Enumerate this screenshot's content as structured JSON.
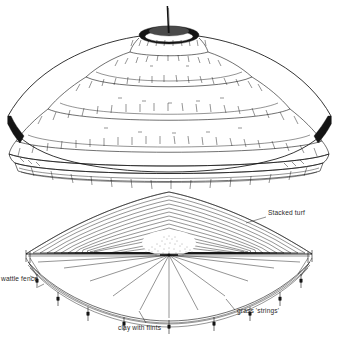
{
  "figure": {
    "background_color": "#ffffff",
    "ink_color": "#111111",
    "views": [
      {
        "id": "upper",
        "name": "perspective-reconstruction",
        "description": "Quarter-cut perspective view of the completed conical stacked-turf mound with central post at the apex",
        "features": [
          "central post",
          "apex opening",
          "concentric stepped turf courses",
          "cut section face",
          "basal wattle fence ring"
        ],
        "ring_count": 6,
        "labels": []
      },
      {
        "id": "lower",
        "name": "cutaway-construction-diagram",
        "description": "Quarter cutaway plan-perspective showing internal construction layers of the mound",
        "features": [
          "stacked turf contour courses",
          "stippled central core",
          "radial grass strings",
          "perimeter wattle fence",
          "clay with flints base"
        ],
        "turf_course_count": 14,
        "labels": [
          {
            "id": "stacked-turf",
            "text": "Stacked turf",
            "position": "upper-right",
            "x": 268,
            "y": 215,
            "anchor": "start"
          },
          {
            "id": "wattle-fence",
            "text": "wattle fence",
            "position": "left",
            "x": 1,
            "y": 281,
            "anchor": "start",
            "clipped_at_edge": true
          },
          {
            "id": "clay-with-flints",
            "text": "clay with flints",
            "position": "bottom-centre",
            "x": 118,
            "y": 330,
            "anchor": "start"
          },
          {
            "id": "grass-strings",
            "text": "grass 'strings'",
            "position": "bottom-right",
            "x": 237,
            "y": 313,
            "anchor": "start"
          }
        ]
      }
    ]
  }
}
